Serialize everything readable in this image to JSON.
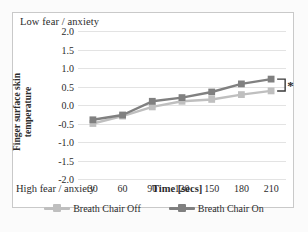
{
  "figure": {
    "top_annotation": "Low fear / anxiety",
    "bottom_annotation": "High fear / anxiety",
    "significance_marker": "*"
  },
  "axes": {
    "ylabel": "Finger surface skin\ntemperature",
    "xlabel": "Time [secs]"
  },
  "colors": {
    "series_off": "#bfbfbf",
    "series_on": "#808080",
    "gridline": "#e3e3e3",
    "frame": "#c9c9c9",
    "text": "#2b2b2b",
    "bracket": "#3a3a3a"
  },
  "legend": [
    {
      "label": "Breath Chair Off",
      "color": "#bfbfbf"
    },
    {
      "label": "Breath Chair On",
      "color": "#808080"
    }
  ],
  "chart_data": {
    "type": "line",
    "title": "",
    "xlabel": "Time [secs]",
    "ylabel": "Finger surface skin temperature",
    "x": [
      30,
      60,
      90,
      120,
      150,
      180,
      210
    ],
    "xticklabels": [
      "30",
      "60",
      "90",
      "120",
      "150",
      "180",
      "210"
    ],
    "yticks": [
      2.0,
      1.5,
      1.0,
      0.5,
      0.0,
      -0.5,
      -1.0,
      -1.5,
      -2.0
    ],
    "yticklabels": [
      "2.0",
      "1.5",
      "1.0",
      "0.5",
      "0.0",
      "-0.5",
      "-1.0",
      "-1.5",
      "-2.0"
    ],
    "ylim": [
      -2.0,
      2.0
    ],
    "grid": true,
    "legend_position": "bottom",
    "annotations": [
      {
        "text": "Low fear / anxiety",
        "position": "top-left"
      },
      {
        "text": "High fear / anxiety",
        "position": "bottom-left"
      },
      {
        "text": "*",
        "position": "right-of-last-points",
        "meaning": "significant difference"
      }
    ],
    "series": [
      {
        "name": "Breath Chair Off",
        "color": "#bfbfbf",
        "marker": "square",
        "values": [
          -0.5,
          -0.3,
          -0.05,
          0.1,
          0.15,
          0.28,
          0.38
        ]
      },
      {
        "name": "Breath Chair On",
        "color": "#808080",
        "marker": "square",
        "values": [
          -0.4,
          -0.27,
          0.1,
          0.2,
          0.35,
          0.57,
          0.7
        ]
      }
    ]
  }
}
